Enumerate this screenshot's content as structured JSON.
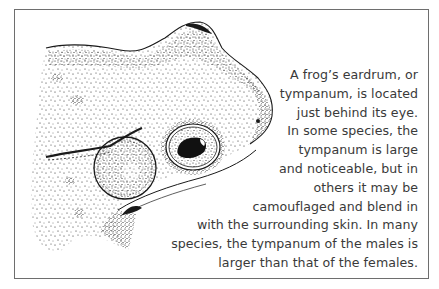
{
  "figure": {
    "labels_visible": false,
    "colors": {
      "ink": "#1a1a1a",
      "text": "#3a3a3a",
      "border": "#6e6e6e",
      "background": "#ffffff"
    }
  },
  "caption": {
    "lines": [
      "A frog’s eardrum, or",
      "tympanum, is located",
      "just behind its eye.",
      "In some species, the",
      "tympanum is large",
      "and noticeable, but in",
      "others it may be",
      "camouflaged and blend in",
      "with the surrounding skin. In many",
      "species, the tympanum of the males is",
      "larger than that of the females."
    ]
  }
}
